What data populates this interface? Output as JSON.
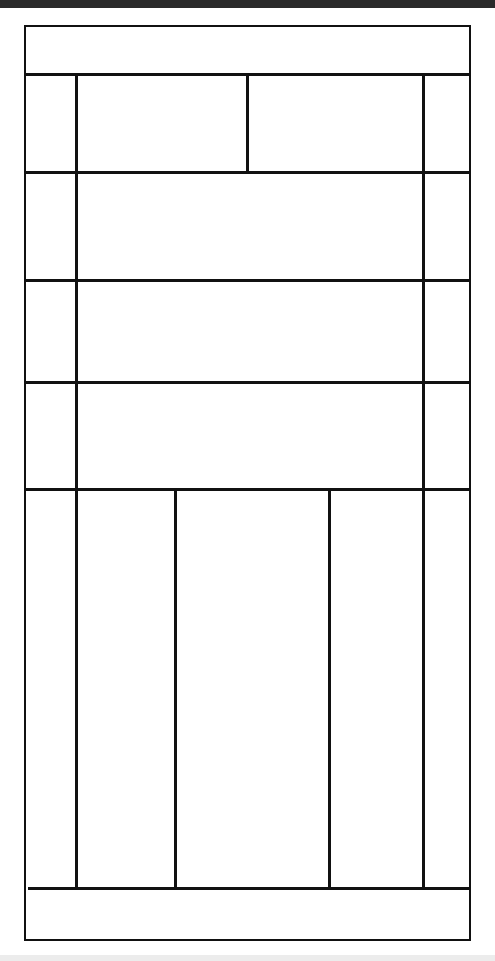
{
  "diagram": {
    "type": "wireframe-grid",
    "colors": {
      "line": "#111111",
      "background": "#ffffff",
      "top_bar": "#2a2a2a",
      "bottom_band": "#ececec"
    },
    "rows": [
      {
        "name": "header",
        "cells": 1
      },
      {
        "name": "row-1",
        "cells": 4
      },
      {
        "name": "row-2",
        "cells": 3
      },
      {
        "name": "row-3",
        "cells": 3
      },
      {
        "name": "row-4",
        "cells": 3
      },
      {
        "name": "row-5",
        "cells": 5
      },
      {
        "name": "footer",
        "cells": 1
      }
    ],
    "labels": []
  }
}
